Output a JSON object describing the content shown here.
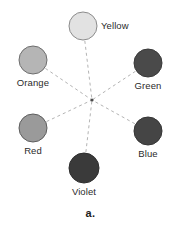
{
  "figure": {
    "caption": "a.",
    "caption_y": 207,
    "width": 181,
    "height": 235,
    "background": "#ffffff"
  },
  "diagram": {
    "type": "color-wheel",
    "center": {
      "x": 92,
      "y": 100
    },
    "center_marker": {
      "name": "center-intersection-point",
      "radius": 1.6,
      "color": "#4a4a4a"
    },
    "connector_style": {
      "color": "#b4b4b4",
      "width": 1,
      "dash": "3,3"
    },
    "nodes": [
      {
        "id": "yellow",
        "label": "Yellow",
        "cx": 83,
        "cy": 26,
        "r": 14,
        "fill": "#e2e2e2",
        "stroke": "#8c8c8c",
        "label_position": "right",
        "label_x": 101,
        "label_y": 26
      },
      {
        "id": "orange",
        "label": "Orange",
        "cx": 33,
        "cy": 60,
        "r": 14,
        "fill": "#b5b5b5",
        "stroke": "#6e6e6e",
        "label_position": "below",
        "label_x": 33,
        "label_y": 78
      },
      {
        "id": "green",
        "label": "Green",
        "cx": 148,
        "cy": 63,
        "r": 14,
        "fill": "#4a4a4a",
        "stroke": "#3a3a3a",
        "label_position": "below",
        "label_x": 148,
        "label_y": 81
      },
      {
        "id": "red",
        "label": "Red",
        "cx": 33,
        "cy": 128,
        "r": 14,
        "fill": "#9a9a9a",
        "stroke": "#5e5e5e",
        "label_position": "below",
        "label_x": 33,
        "label_y": 146
      },
      {
        "id": "blue",
        "label": "Blue",
        "cx": 148,
        "cy": 131,
        "r": 14,
        "fill": "#454545",
        "stroke": "#353535",
        "label_position": "below",
        "label_x": 148,
        "label_y": 149
      },
      {
        "id": "violet",
        "label": "Violet",
        "cx": 84,
        "cy": 168,
        "r": 15,
        "fill": "#3a3a3a",
        "stroke": "#2e2e2e",
        "label_position": "below",
        "label_x": 84,
        "label_y": 187
      }
    ],
    "connections": [
      {
        "from": "yellow",
        "to": "violet"
      },
      {
        "from": "orange",
        "to": "blue"
      },
      {
        "from": "green",
        "to": "red"
      }
    ]
  }
}
